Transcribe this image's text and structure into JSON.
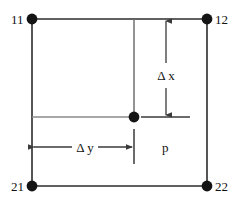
{
  "diagram": {
    "colors": {
      "outline": "#2b2b2b",
      "inner_line": "#7a7a7a",
      "node_fill": "#141414",
      "dimension": "#3a3a3a",
      "background": "#ffffff",
      "text": "#131313"
    },
    "corner_nodes": [
      {
        "id": "node-11",
        "label": "11",
        "x": 32,
        "y": 19,
        "label_x": 11,
        "label_y": 24,
        "label_anchor": "start"
      },
      {
        "id": "node-12",
        "label": "12",
        "x": 207,
        "y": 19,
        "label_x": 216,
        "label_y": 24,
        "label_anchor": "start"
      },
      {
        "id": "node-21",
        "label": "21",
        "x": 32,
        "y": 186,
        "label_x": 11,
        "label_y": 191,
        "label_anchor": "start"
      },
      {
        "id": "node-22",
        "label": "22",
        "x": 207,
        "y": 186,
        "label_x": 216,
        "label_y": 191,
        "label_anchor": "start"
      }
    ],
    "interior_point": {
      "id": "point-p",
      "label": "p",
      "x": 134,
      "y": 117,
      "label_x": 162,
      "label_y": 152
    },
    "dimensions": [
      {
        "id": "delta-x",
        "label": "Δ x",
        "orientation": "vertical",
        "axis_x": 166,
        "from_y": 19,
        "to_y": 117,
        "label_x": 166,
        "label_y": 76
      },
      {
        "id": "delta-y",
        "label": "Δ y",
        "orientation": "horizontal",
        "axis_y": 147,
        "from_x": 32,
        "to_x": 134,
        "label_x": 83,
        "label_y": 152
      }
    ],
    "rect": {
      "left": 32,
      "top": 19,
      "right": 207,
      "bottom": 186
    }
  }
}
